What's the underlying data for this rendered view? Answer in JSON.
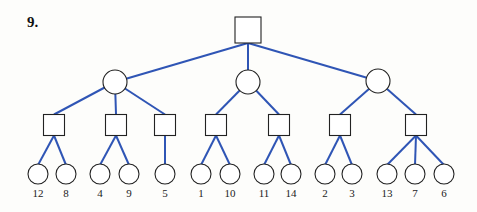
{
  "problem": {
    "number": "9."
  },
  "colors": {
    "edge": "#2f55b5",
    "node_stroke": "#222222",
    "node_fill": "#ffffff"
  },
  "tree": {
    "root": {
      "shape": "square",
      "cx": 248,
      "cy": 30,
      "size": 26
    },
    "level1": [
      {
        "shape": "circle",
        "cx": 115,
        "cy": 82,
        "r": 12
      },
      {
        "shape": "circle",
        "cx": 248,
        "cy": 82,
        "r": 12
      },
      {
        "shape": "circle",
        "cx": 378,
        "cy": 81,
        "r": 12
      }
    ],
    "level2": [
      {
        "shape": "square",
        "parent": 0,
        "cx": 54,
        "cy": 125,
        "size": 21
      },
      {
        "shape": "square",
        "parent": 0,
        "cx": 116,
        "cy": 125,
        "size": 21
      },
      {
        "shape": "square",
        "parent": 0,
        "cx": 165,
        "cy": 125,
        "size": 21
      },
      {
        "shape": "square",
        "parent": 1,
        "cx": 216,
        "cy": 125,
        "size": 21
      },
      {
        "shape": "square",
        "parent": 1,
        "cx": 279,
        "cy": 125,
        "size": 21
      },
      {
        "shape": "square",
        "parent": 2,
        "cx": 340,
        "cy": 125,
        "size": 21
      },
      {
        "shape": "square",
        "parent": 2,
        "cx": 416,
        "cy": 125,
        "size": 21
      }
    ],
    "leaves": [
      {
        "parent": 0,
        "cx": 38,
        "cy": 174,
        "label": "12"
      },
      {
        "parent": 0,
        "cx": 66,
        "cy": 174,
        "label": "8"
      },
      {
        "parent": 1,
        "cx": 100,
        "cy": 174,
        "label": "4"
      },
      {
        "parent": 1,
        "cx": 129,
        "cy": 174,
        "label": "9"
      },
      {
        "parent": 2,
        "cx": 165,
        "cy": 174,
        "label": "5"
      },
      {
        "parent": 3,
        "cx": 201,
        "cy": 174,
        "label": "1"
      },
      {
        "parent": 3,
        "cx": 230,
        "cy": 174,
        "label": "10"
      },
      {
        "parent": 4,
        "cx": 264,
        "cy": 174,
        "label": "11"
      },
      {
        "parent": 4,
        "cx": 291,
        "cy": 174,
        "label": "14"
      },
      {
        "parent": 5,
        "cx": 325,
        "cy": 174,
        "label": "2"
      },
      {
        "parent": 5,
        "cx": 352,
        "cy": 174,
        "label": "3"
      },
      {
        "parent": 6,
        "cx": 387,
        "cy": 174,
        "label": "13"
      },
      {
        "parent": 6,
        "cx": 415,
        "cy": 174,
        "label": "7"
      },
      {
        "parent": 6,
        "cx": 444,
        "cy": 174,
        "label": "6"
      }
    ],
    "leaf_radius": 10,
    "label_y": 197
  }
}
